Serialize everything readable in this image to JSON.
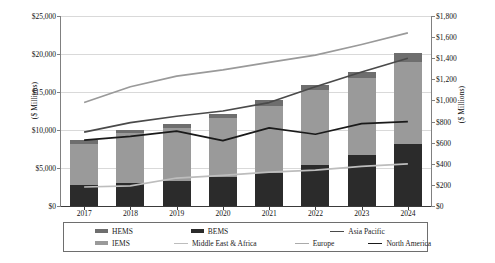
{
  "chart_data": {
    "type": "bar",
    "title": "",
    "subtitle": "",
    "xlabel": "",
    "ylabel": "($ Millions)",
    "ylabel_secondary": "($ Millions)",
    "categories": [
      "2017",
      "2018",
      "2019",
      "2020",
      "2021",
      "2022",
      "2023",
      "2024"
    ],
    "ylim": [
      0,
      25000
    ],
    "yticks": [
      "$0",
      "$5,000",
      "$10,000",
      "$15,000",
      "$20,000",
      "$25,000"
    ],
    "ytick_values": [
      0,
      5000,
      10000,
      15000,
      20000,
      25000
    ],
    "ylim_secondary": [
      0,
      1800
    ],
    "yticks_secondary": [
      "$0",
      "$200",
      "$400",
      "$600",
      "$800",
      "$1,000",
      "$1,200",
      "$1,400",
      "$1,600",
      "$1,800"
    ],
    "ytick_values_secondary": [
      0,
      200,
      400,
      600,
      800,
      1000,
      1200,
      1400,
      1600,
      1800
    ],
    "grid": true,
    "legend_position": "bottom",
    "stacked": true,
    "series": [
      {
        "name": "BEMS",
        "type": "bar",
        "axis": "left",
        "color": "#2b2b2b",
        "values": [
          2700,
          3050,
          3350,
          3800,
          4350,
          5400,
          6700,
          8100
        ]
      },
      {
        "name": "IEMS",
        "type": "bar",
        "axis": "left",
        "color": "#9a9a9a",
        "values": [
          5500,
          6500,
          6900,
          7800,
          8850,
          9850,
          10200,
          10900
        ]
      },
      {
        "name": "HEMS",
        "type": "bar",
        "axis": "left",
        "color": "#6e6e6e",
        "values": [
          500,
          450,
          550,
          500,
          700,
          650,
          700,
          1200
        ]
      },
      {
        "name": "Asia Pacific",
        "type": "line",
        "axis": "right",
        "color": "#9a9a9a",
        "values": [
          980,
          1130,
          1230,
          1290,
          1360,
          1430,
          1530,
          1640
        ]
      },
      {
        "name": "Europe",
        "type": "line",
        "axis": "right",
        "color": "#4a4a4a",
        "values": [
          700,
          790,
          850,
          900,
          980,
          1130,
          1270,
          1400
        ]
      },
      {
        "name": "North America",
        "type": "line",
        "axis": "right",
        "color": "#1a1a1a",
        "values": [
          625,
          660,
          710,
          620,
          740,
          680,
          780,
          800
        ]
      },
      {
        "name": "Middle East & Africa",
        "type": "line",
        "axis": "right",
        "color": "#bdbdbd",
        "values": [
          180,
          190,
          265,
          290,
          320,
          340,
          375,
          400
        ]
      }
    ],
    "totals": [
      8700,
      10000,
      10800,
      12100,
      13900,
      15900,
      17600,
      20200
    ]
  },
  "legend": {
    "row1": [
      {
        "label": "HEMS",
        "swatch": "bar",
        "color": "#6e6e6e"
      },
      {
        "label": "BEMS",
        "swatch": "bar",
        "color": "#2b2b2b"
      },
      {
        "label": "Asia Pacific",
        "swatch": "line",
        "color": "#4a4a4a"
      }
    ],
    "row2": [
      {
        "label": "IEMS",
        "swatch": "bar",
        "color": "#9a9a9a"
      },
      {
        "label": "Middle East & Africa",
        "swatch": "line",
        "color": "#bdbdbd"
      },
      {
        "label": "Europe",
        "swatch": "line",
        "color": "#aaaaaa"
      },
      {
        "label": "North America",
        "swatch": "line",
        "color": "#1a1a1a"
      }
    ]
  },
  "colors": {
    "grid": "#d9d9d9",
    "axis": "#808080",
    "plot_background": "#ffffff"
  }
}
